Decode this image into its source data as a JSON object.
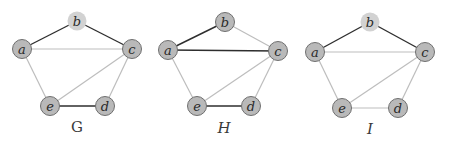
{
  "colors": {
    "node_fill": "#b9b9b9",
    "node_stroke": "#6f6f6f",
    "node_highlight_fill": "#d2d2d2",
    "edge_dark": "#2e2e2e",
    "edge_light": "#bdbdbd"
  },
  "graphs": [
    {
      "name": "G",
      "italic": false,
      "label_pos": [
        77,
        132
      ],
      "nodes": [
        {
          "id": "a",
          "x": 22,
          "y": 49,
          "highlight": false
        },
        {
          "id": "b",
          "x": 77,
          "y": 21,
          "highlight": true
        },
        {
          "id": "c",
          "x": 132,
          "y": 49,
          "highlight": false
        },
        {
          "id": "d",
          "x": 105,
          "y": 106,
          "highlight": false
        },
        {
          "id": "e",
          "x": 50,
          "y": 106,
          "highlight": false
        }
      ],
      "edges": [
        {
          "from": "a",
          "to": "b",
          "style": "dark"
        },
        {
          "from": "b",
          "to": "c",
          "style": "dark"
        },
        {
          "from": "a",
          "to": "c",
          "style": "light"
        },
        {
          "from": "a",
          "to": "e",
          "style": "light"
        },
        {
          "from": "c",
          "to": "e",
          "style": "light"
        },
        {
          "from": "c",
          "to": "d",
          "style": "light"
        },
        {
          "from": "e",
          "to": "d",
          "style": "dark"
        }
      ]
    },
    {
      "name": "H",
      "italic": true,
      "label_pos": [
        224,
        133
      ],
      "nodes": [
        {
          "id": "a",
          "x": 168,
          "y": 50,
          "highlight": false
        },
        {
          "id": "b",
          "x": 225,
          "y": 22,
          "highlight": false
        },
        {
          "id": "c",
          "x": 278,
          "y": 51,
          "highlight": false
        },
        {
          "id": "d",
          "x": 251,
          "y": 106,
          "highlight": false
        },
        {
          "id": "e",
          "x": 197,
          "y": 106,
          "highlight": false
        }
      ],
      "edges": [
        {
          "from": "a",
          "to": "b",
          "style": "dark"
        },
        {
          "from": "b",
          "to": "c",
          "style": "light"
        },
        {
          "from": "a",
          "to": "c",
          "style": "dark"
        },
        {
          "from": "a",
          "to": "e",
          "style": "light"
        },
        {
          "from": "c",
          "to": "e",
          "style": "light"
        },
        {
          "from": "c",
          "to": "d",
          "style": "light"
        },
        {
          "from": "e",
          "to": "d",
          "style": "dark"
        }
      ]
    },
    {
      "name": "I",
      "italic": true,
      "label_pos": [
        370,
        134
      ],
      "nodes": [
        {
          "id": "a",
          "x": 315,
          "y": 52,
          "highlight": false
        },
        {
          "id": "b",
          "x": 370,
          "y": 22,
          "highlight": true
        },
        {
          "id": "c",
          "x": 425,
          "y": 52,
          "highlight": false
        },
        {
          "id": "d",
          "x": 398,
          "y": 108,
          "highlight": false
        },
        {
          "id": "e",
          "x": 342,
          "y": 108,
          "highlight": false
        }
      ],
      "edges": [
        {
          "from": "a",
          "to": "b",
          "style": "dark"
        },
        {
          "from": "b",
          "to": "c",
          "style": "dark"
        },
        {
          "from": "a",
          "to": "c",
          "style": "light"
        },
        {
          "from": "a",
          "to": "e",
          "style": "light"
        },
        {
          "from": "c",
          "to": "e",
          "style": "light"
        },
        {
          "from": "c",
          "to": "d",
          "style": "light"
        },
        {
          "from": "e",
          "to": "d",
          "style": "light"
        }
      ]
    }
  ]
}
